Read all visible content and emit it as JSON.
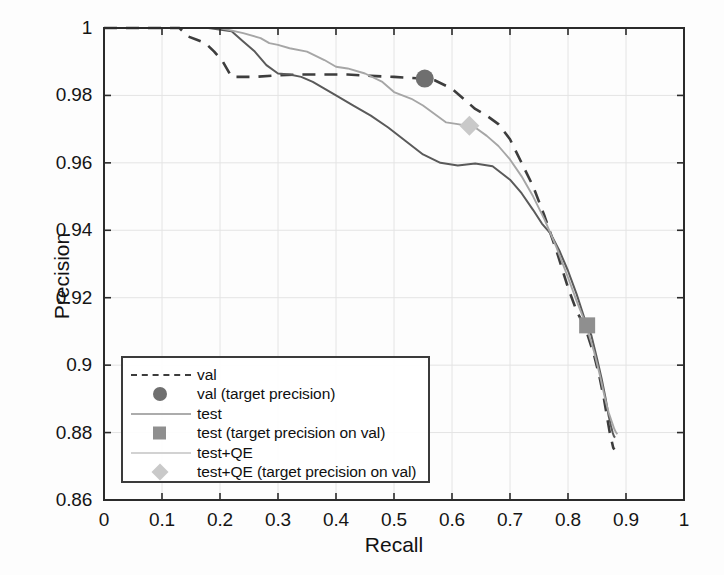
{
  "chart_data": {
    "type": "line",
    "title": "",
    "xlabel": "Recall",
    "ylabel": "Precision",
    "xlim": [
      0,
      1
    ],
    "ylim": [
      0.86,
      1
    ],
    "grid": true,
    "legend_position": "lower-left-inside",
    "xticks": [
      "0",
      "0.1",
      "0.2",
      "0.3",
      "0.4",
      "0.5",
      "0.6",
      "0.7",
      "0.8",
      "0.9",
      "1"
    ],
    "xtick_values": [
      0,
      0.1,
      0.2,
      0.3,
      0.4,
      0.5,
      0.6,
      0.7,
      0.8,
      0.9,
      1
    ],
    "yticks": [
      "0.86",
      "0.88",
      "0.9",
      "0.92",
      "0.94",
      "0.96",
      "0.98",
      "1"
    ],
    "ytick_values": [
      0.86,
      0.88,
      0.9,
      0.92,
      0.94,
      0.96,
      0.98,
      1
    ],
    "series": [
      {
        "name": "val",
        "style": "dashed",
        "color": "#3d3d3d",
        "x": [
          0.0,
          0.08,
          0.13,
          0.145,
          0.16,
          0.175,
          0.19,
          0.205,
          0.22,
          0.26,
          0.3,
          0.34,
          0.38,
          0.42,
          0.46,
          0.5,
          0.53,
          0.55,
          0.57,
          0.6,
          0.62,
          0.64,
          0.66,
          0.68,
          0.7,
          0.72,
          0.74,
          0.76,
          0.78,
          0.8,
          0.815,
          0.83,
          0.845,
          0.855,
          0.862,
          0.868,
          0.872,
          0.876,
          0.878,
          0.88
        ],
        "y": [
          1.0,
          1.0,
          1.0,
          0.9975,
          0.9965,
          0.9955,
          0.993,
          0.99,
          0.9855,
          0.9855,
          0.986,
          0.9862,
          0.9862,
          0.9862,
          0.9858,
          0.9855,
          0.9852,
          0.985,
          0.9845,
          0.982,
          0.979,
          0.976,
          0.974,
          0.9715,
          0.967,
          0.96,
          0.953,
          0.944,
          0.934,
          0.923,
          0.916,
          0.911,
          0.903,
          0.896,
          0.89,
          0.884,
          0.88,
          0.877,
          0.8755,
          0.875
        ]
      },
      {
        "name": "test",
        "style": "solid",
        "color": "#5a5a5a",
        "x": [
          0.0,
          0.1,
          0.18,
          0.22,
          0.24,
          0.26,
          0.28,
          0.3,
          0.32,
          0.34,
          0.36,
          0.38,
          0.4,
          0.43,
          0.46,
          0.49,
          0.52,
          0.55,
          0.58,
          0.61,
          0.64,
          0.67,
          0.7,
          0.72,
          0.74,
          0.755,
          0.77,
          0.785,
          0.8,
          0.815,
          0.83,
          0.84,
          0.85,
          0.858,
          0.865,
          0.87,
          0.874,
          0.877,
          0.879,
          0.881
        ],
        "y": [
          1.0,
          1.0,
          1.0,
          0.999,
          0.996,
          0.993,
          0.989,
          0.9865,
          0.9862,
          0.9855,
          0.984,
          0.982,
          0.98,
          0.977,
          0.974,
          0.9705,
          0.9665,
          0.9625,
          0.96,
          0.9592,
          0.9598,
          0.959,
          0.955,
          0.951,
          0.946,
          0.942,
          0.939,
          0.934,
          0.928,
          0.921,
          0.913,
          0.909,
          0.902,
          0.896,
          0.89,
          0.885,
          0.882,
          0.88,
          0.879,
          0.8785
        ]
      },
      {
        "name": "test+QE",
        "style": "solid",
        "color": "#a6a6a6",
        "x": [
          0.0,
          0.12,
          0.2,
          0.24,
          0.27,
          0.285,
          0.3,
          0.32,
          0.35,
          0.38,
          0.4,
          0.42,
          0.45,
          0.48,
          0.5,
          0.53,
          0.55,
          0.57,
          0.59,
          0.61,
          0.625,
          0.64,
          0.66,
          0.68,
          0.7,
          0.72,
          0.74,
          0.76,
          0.78,
          0.8,
          0.815,
          0.83,
          0.845,
          0.855,
          0.864,
          0.87,
          0.876,
          0.88,
          0.883,
          0.885
        ],
        "y": [
          1.0,
          1.0,
          1.0,
          0.9985,
          0.997,
          0.9955,
          0.995,
          0.994,
          0.993,
          0.9905,
          0.9885,
          0.988,
          0.9865,
          0.984,
          0.981,
          0.979,
          0.977,
          0.9745,
          0.972,
          0.9715,
          0.971,
          0.9705,
          0.968,
          0.965,
          0.961,
          0.956,
          0.95,
          0.943,
          0.935,
          0.926,
          0.919,
          0.9125,
          0.904,
          0.897,
          0.89,
          0.886,
          0.883,
          0.881,
          0.88,
          0.8795
        ]
      }
    ],
    "markers": [
      {
        "name": "val (target precision)",
        "shape": "circle",
        "color": "#6f6f6f",
        "x": 0.553,
        "y": 0.985
      },
      {
        "name": "test (target precision on val)",
        "shape": "square",
        "color": "#8f8f8f",
        "x": 0.833,
        "y": 0.9118
      },
      {
        "name": "test+QE (target precision on val)",
        "shape": "diamond",
        "color": "#c9c9c9",
        "x": 0.63,
        "y": 0.971
      }
    ]
  },
  "legend": {
    "entries": [
      {
        "label": "val",
        "key": "dash"
      },
      {
        "label": "val (target precision)",
        "key": "circle"
      },
      {
        "label": "test",
        "key": "solid-dark"
      },
      {
        "label": "test (target precision on val)",
        "key": "square"
      },
      {
        "label": "test+QE",
        "key": "solid-light"
      },
      {
        "label": "test+QE (target precision on val)",
        "key": "diamond"
      }
    ]
  },
  "colors": {
    "val": "#3d3d3d",
    "test": "#5a5a5a",
    "test_qe": "#a6a6a6",
    "marker_circle": "#6f6f6f",
    "marker_square": "#8f8f8f",
    "marker_diamond": "#c9c9c9",
    "axis": "#2b2b2b",
    "grid": "#e4e4e4"
  }
}
